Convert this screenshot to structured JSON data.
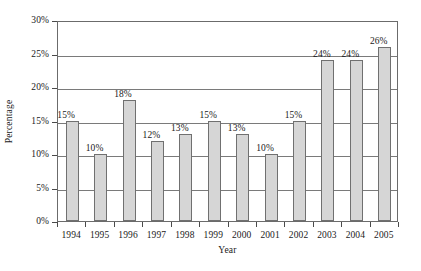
{
  "chart_data": {
    "type": "bar",
    "title": "",
    "subtitle": "",
    "xlabel": "Year",
    "ylabel": "Percentage",
    "categories": [
      "1994",
      "1995",
      "1996",
      "1997",
      "1998",
      "1999",
      "2000",
      "2001",
      "2002",
      "2003",
      "2004",
      "2005"
    ],
    "values": [
      15,
      10,
      18,
      12,
      13,
      15,
      13,
      10,
      15,
      24,
      24,
      26
    ],
    "data_labels": [
      "15%",
      "10%",
      "18%",
      "12%",
      "13%",
      "15%",
      "13%",
      "10%",
      "15%",
      "24%",
      "24%",
      "26%"
    ],
    "ylim": [
      0,
      30
    ],
    "ytick_values": [
      0,
      5,
      10,
      15,
      20,
      25,
      30
    ],
    "ytick_labels": [
      "0%",
      "5%",
      "10%",
      "15%",
      "20%",
      "25%",
      "30%"
    ],
    "grid": true,
    "grid_axis": "y",
    "legend": false,
    "legend_position": "none",
    "bar_fill_color": "#d6d6d6",
    "bar_border_color": "#707070",
    "axis_color": "#6b6b6b",
    "grid_color": "#7a7a7a",
    "text_color": "#1a1a1a",
    "background_color": "#ffffff"
  }
}
